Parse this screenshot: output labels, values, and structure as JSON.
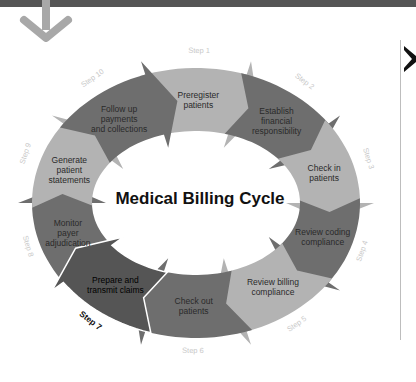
{
  "title": "Medical Billing Cycle",
  "colors": {
    "light": "#b3b3b3",
    "dark": "#6e6e6e",
    "active": "#555555",
    "topbar": "#555555",
    "down_arrow": "#a8a8a8",
    "step_text": "#c9c9c9"
  },
  "steps": [
    {
      "step": "Step 1",
      "label_lines": [
        "Preregister",
        "patients"
      ],
      "shade": "light"
    },
    {
      "step": "Step 2",
      "label_lines": [
        "Establish",
        "financial",
        "responsibility"
      ],
      "shade": "dark"
    },
    {
      "step": "Step 3",
      "label_lines": [
        "Check in",
        "patients"
      ],
      "shade": "light"
    },
    {
      "step": "Step 4",
      "label_lines": [
        "Review coding",
        "compliance"
      ],
      "shade": "dark"
    },
    {
      "step": "Step 5",
      "label_lines": [
        "Review billing",
        "compliance"
      ],
      "shade": "light"
    },
    {
      "step": "Step 6",
      "label_lines": [
        "Check out",
        "patients"
      ],
      "shade": "dark"
    },
    {
      "step": "Step 7",
      "label_lines": [
        "Prepare and",
        "transmit claims"
      ],
      "shade": "active",
      "highlighted": true
    },
    {
      "step": "Step 8",
      "label_lines": [
        "Monitor",
        "payer",
        "adjudication"
      ],
      "shade": "dark"
    },
    {
      "step": "Step 9",
      "label_lines": [
        "Generate",
        "patient",
        "statements"
      ],
      "shade": "light"
    },
    {
      "step": "Step 10",
      "label_lines": [
        "Follow up",
        "payments",
        "and collections"
      ],
      "shade": "dark"
    }
  ],
  "icons": {
    "down_arrow": "down-arrow-icon",
    "side_glyph": "close-icon"
  }
}
